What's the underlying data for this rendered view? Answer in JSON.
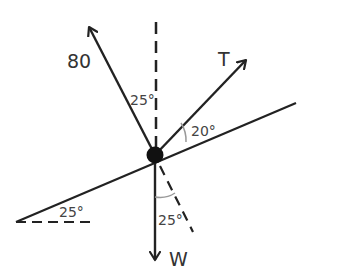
{
  "diagram": {
    "colors": {
      "stroke": "#222222",
      "text": "#333333",
      "angle_arc": "#999999",
      "background": "#ffffff"
    },
    "forces": [
      {
        "id": "force-80",
        "label": "80",
        "direction": "up-left, 25° from vertical"
      },
      {
        "id": "force-T",
        "label": "T",
        "direction": "20° above incline"
      },
      {
        "id": "force-W",
        "label": "W",
        "direction": "straight down"
      }
    ],
    "angles": [
      {
        "id": "angle-80-vertical",
        "label": "25°"
      },
      {
        "id": "angle-T-incline",
        "label": "20°"
      },
      {
        "id": "angle-incline-horizontal",
        "label": "25°"
      },
      {
        "id": "angle-W-normal",
        "label": "25°"
      }
    ]
  }
}
